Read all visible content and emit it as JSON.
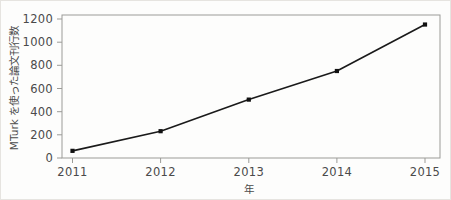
{
  "chart_data": {
    "type": "line",
    "title": "",
    "xlabel": "年",
    "ylabel": "MTurk を使った論文刊行数",
    "categories": [
      "2011",
      "2012",
      "2013",
      "2014",
      "2015"
    ],
    "x": [
      2011,
      2012,
      2013,
      2014,
      2015
    ],
    "values": [
      60,
      225,
      490,
      730,
      1120
    ],
    "series": [
      {
        "name": "MTurk を使った論文刊行数",
        "values": [
          60,
          225,
          490,
          730,
          1120
        ],
        "color": "#111111",
        "marker": "square",
        "line_style": "solid"
      }
    ],
    "ylim": [
      0,
      1200
    ],
    "yticks": [
      0,
      200,
      400,
      600,
      800,
      1000,
      1200
    ],
    "ytick_labels": [
      "0",
      "200",
      "400",
      "600",
      "800",
      "1000",
      "1200"
    ],
    "xtick_labels": [
      "2011",
      "2012",
      "2013",
      "2014",
      "2015"
    ],
    "grid": false,
    "legend": false,
    "legend_position": "none",
    "frame": "box",
    "background_color": "#fdfdfc",
    "axis_color": "#9b9b97",
    "text_color": "#4a4a4a"
  },
  "ylabel_chars": [
    "M",
    "T",
    "u",
    "r",
    "k",
    " ",
    "を",
    "使",
    "っ",
    "た",
    "論",
    "文",
    "刊",
    "行",
    "数"
  ]
}
